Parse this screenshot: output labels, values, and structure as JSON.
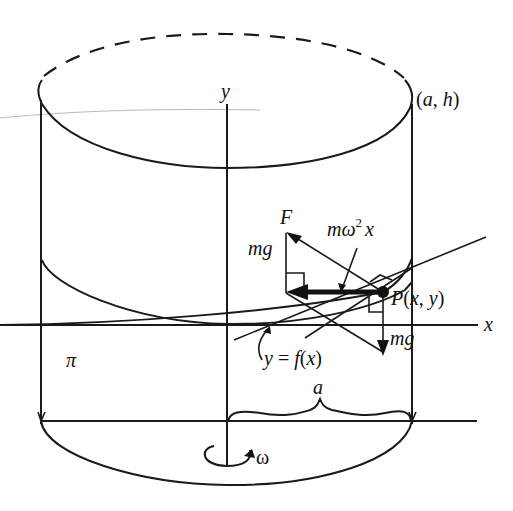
{
  "figure": {
    "labels": {
      "y_axis": "y",
      "x_axis": "x",
      "top_corner": "(a, h)",
      "force_F": "F",
      "mg_left": "mg",
      "centripetal": "mω² x",
      "centripetal_m": "mω",
      "centripetal_sup": "2",
      "centripetal_x": "x",
      "point": "P(x, y)",
      "mg_right": "mg",
      "curve": "y = f(x)",
      "pi_label": "π",
      "radius": "a",
      "omega": "ω"
    },
    "colors": {
      "ink": "#1a1a1a",
      "background": "#ffffff",
      "faint": "#bbbbbb"
    }
  }
}
